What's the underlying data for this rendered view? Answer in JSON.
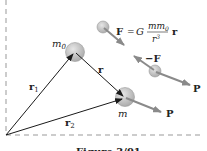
{
  "figure": {
    "caption": "Figure 3/91",
    "labels": {
      "m0_base": "m",
      "m0_sub": "0",
      "m": "m",
      "r": "r",
      "r1_base": "r",
      "r1_sub": "1",
      "r2_base": "r",
      "r2_sub": "2",
      "P_upper": "P",
      "P_lower": "P",
      "minus_F": "−F"
    },
    "equation": {
      "lhs": "F",
      "equals": "=",
      "G": "G",
      "numerator_base": "mm",
      "numerator_sub": "0",
      "denominator_base": "r",
      "denominator_sup": "3",
      "vector": "r"
    },
    "colors": {
      "line": "#1a1a1a",
      "arrow_gray": "#8a8a8a",
      "sphere_fill": "#c8c8c8",
      "sphere_stroke": "#a0a0a0",
      "dash": "#999999"
    }
  }
}
